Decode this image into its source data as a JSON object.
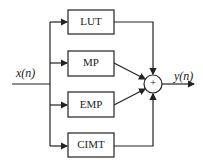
{
  "diagram": {
    "input_label": "x(n)",
    "output_label": "y(n)",
    "summer_symbol": "+",
    "blocks": [
      {
        "label": "LUT"
      },
      {
        "label": "MP"
      },
      {
        "label": "EMP"
      },
      {
        "label": "CIMT"
      }
    ]
  }
}
